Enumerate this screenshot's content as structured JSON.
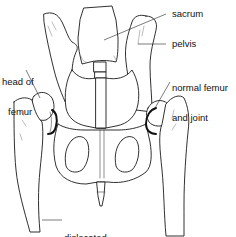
{
  "diagram": {
    "labels": {
      "sacrum": "sacrum",
      "pelvis": "pelvis",
      "head_of_femur_line1": "head of",
      "head_of_femur_line2": "femur",
      "normal_femur_line1": "normal femur",
      "normal_femur_line2": "and joint",
      "dislocated_femur_line1": "dislocated",
      "dislocated_femur_line2": "femur"
    },
    "colors": {
      "line": "#1a1a1a",
      "background": "#ffffff"
    }
  }
}
